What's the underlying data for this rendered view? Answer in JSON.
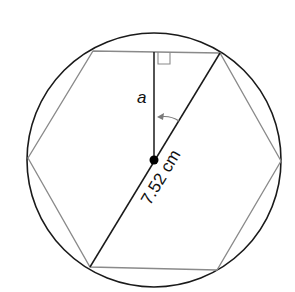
{
  "diagram": {
    "labels": {
      "apothem": "a",
      "radius": "7.52 cm"
    },
    "colors": {
      "circle": "#1a1a1a",
      "hexagon": "#8a8a8a",
      "apothem": "#1a1a1a",
      "diagonal": "#1a1a1a",
      "arrow": "#7a7a7a",
      "center_dot": "#000000"
    }
  }
}
